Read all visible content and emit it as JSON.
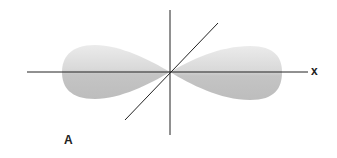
{
  "diagram": {
    "axis_label_x": "x",
    "panel_label": "A",
    "colors": {
      "lobe_light": "#efefef",
      "lobe_dark": "#b5b5b5",
      "axis": "#222222"
    }
  }
}
